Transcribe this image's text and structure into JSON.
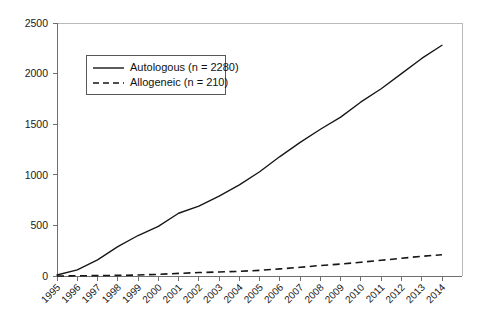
{
  "chart_data": {
    "type": "line",
    "title": "",
    "subtitle": "",
    "xlabel": "",
    "ylabel": "",
    "categories": [
      "1995",
      "1996",
      "1997",
      "1998",
      "1999",
      "2000",
      "2001",
      "2002",
      "2003",
      "2004",
      "2005",
      "2006",
      "2007",
      "2008",
      "2009",
      "2010",
      "2011",
      "2012",
      "2013",
      "2014"
    ],
    "x": [
      1995,
      1996,
      1997,
      1998,
      1999,
      2000,
      2001,
      2002,
      2003,
      2004,
      2005,
      2006,
      2007,
      2008,
      2009,
      2010,
      2011,
      2012,
      2013,
      2014
    ],
    "series": [
      {
        "name": "Autologous (n = 2280)",
        "short_name": "Autologous",
        "n": 2280,
        "style": "solid",
        "color": "#161616",
        "values": [
          10,
          60,
          160,
          290,
          400,
          490,
          620,
          690,
          790,
          900,
          1030,
          1180,
          1320,
          1450,
          1570,
          1720,
          1850,
          2000,
          2150,
          2280
        ]
      },
      {
        "name": "Allogeneic (n = 210)",
        "short_name": "Allogeneic",
        "n": 210,
        "style": "dashed",
        "color": "#161616",
        "values": [
          0,
          2,
          4,
          6,
          10,
          16,
          26,
          34,
          40,
          46,
          56,
          70,
          86,
          104,
          118,
          136,
          155,
          175,
          195,
          210
        ]
      }
    ],
    "ylim": [
      0,
      2500
    ],
    "yticks": [
      0,
      500,
      1000,
      1500,
      2000,
      2500
    ],
    "ytick_labels": [
      "0",
      "500",
      "1000",
      "1500",
      "2000",
      "2500"
    ],
    "xlim": [
      1995,
      2014
    ],
    "grid": false,
    "legend_position": "upper-left-inset",
    "xtick_label_rotation": 45
  },
  "legend": {
    "entries": [
      {
        "label": "Autologous (n = 2280)",
        "style": "solid"
      },
      {
        "label": "Allogeneic (n = 210)",
        "style": "dashed"
      }
    ]
  },
  "colors": {
    "background": "#ffffff",
    "series_line": "#161616",
    "axis": "#6f6f6f",
    "frame": "#b9b9b9",
    "text": "#111111"
  }
}
